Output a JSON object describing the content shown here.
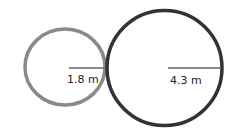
{
  "diagram": {
    "type": "two tangent circles with radii",
    "circles": [
      {
        "name": "small-circle",
        "radius_label": "1.8 m",
        "stroke": "#8a8a8a"
      },
      {
        "name": "large-circle",
        "radius_label": "4.3 m",
        "stroke": "#333333"
      }
    ]
  }
}
